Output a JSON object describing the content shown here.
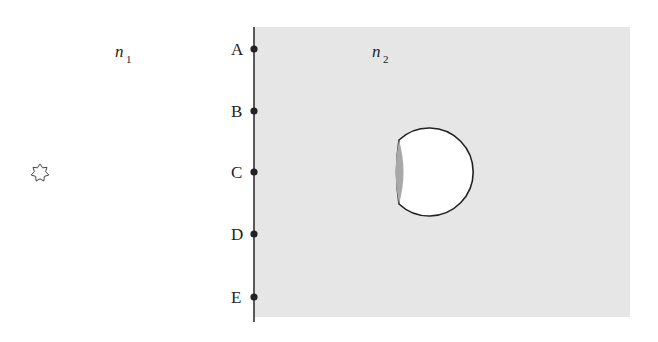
{
  "diagram": {
    "medium_left": {
      "label": "n",
      "subscript": "1"
    },
    "medium_right": {
      "label": "n",
      "subscript": "2",
      "fill": "#e6e6e6"
    },
    "interface_points": [
      {
        "label": "A"
      },
      {
        "label": "B"
      },
      {
        "label": "C"
      },
      {
        "label": "D"
      },
      {
        "label": "E"
      }
    ],
    "source": {
      "icon": "star-icon",
      "symbol": "✡"
    },
    "object": {
      "type": "sphere-with-lens",
      "lens_fill": "#a9a9a9",
      "fill": "#ffffff"
    }
  }
}
